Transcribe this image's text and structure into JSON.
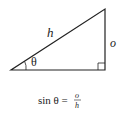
{
  "diagram": {
    "labels": {
      "hypotenuse": "h",
      "opposite": "o",
      "angle": "θ"
    },
    "formula": {
      "lhs": "sin θ =",
      "numerator": "o",
      "denominator": "h"
    },
    "colors": {
      "stroke": "#222222",
      "background": "#ffffff"
    }
  }
}
